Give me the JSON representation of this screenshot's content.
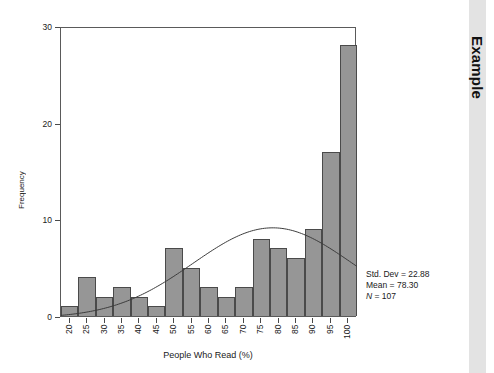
{
  "sidebar": {
    "label": "Example"
  },
  "chart_data": {
    "type": "bar",
    "subtype": "histogram",
    "title": "",
    "xlabel": "People Who Read (%)",
    "ylabel": "Frequency",
    "categories": [
      "20",
      "25",
      "30",
      "35",
      "40",
      "45",
      "50",
      "55",
      "60",
      "65",
      "70",
      "75",
      "80",
      "85",
      "90",
      "95",
      "100"
    ],
    "values": [
      1,
      4,
      2,
      3,
      2,
      1,
      7,
      5,
      3,
      2,
      3,
      8,
      7,
      6,
      9,
      17,
      28
    ],
    "xlim": [
      17.5,
      102.5
    ],
    "ylim": [
      0,
      30
    ],
    "xticks": [
      "20",
      "25",
      "30",
      "35",
      "40",
      "45",
      "50",
      "55",
      "60",
      "65",
      "70",
      "75",
      "80",
      "85",
      "90",
      "95",
      "100"
    ],
    "yticks": [
      "0",
      "10",
      "20",
      "30"
    ],
    "grid": false,
    "legend": false,
    "bar_color": "#969696",
    "bar_edge_color": "#4a4a4a",
    "overlay": {
      "type": "normal-curve",
      "name": "normal-distribution-curve",
      "color": "#3c3c3c",
      "mean": 78.3,
      "std_dev": 22.88,
      "n": 107
    },
    "annotations": {
      "std_dev_line": "Std. Dev = 22.88",
      "mean_line": "Mean = 78.30",
      "n_label": "N",
      "n_value": " = 107"
    }
  }
}
